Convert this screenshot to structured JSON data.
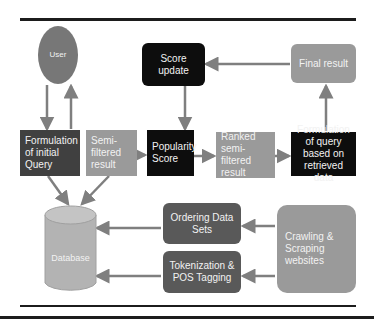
{
  "diagram": {
    "nodes": {
      "user": "User",
      "initial_query": "Formulation of initial Query",
      "semi_filtered": "Semi-filtered result",
      "popularity": "Popularity Score",
      "ranked": "Ranked semi-filtered result",
      "query_retrieved": "Formulation of query based on retrieved data",
      "score_update": "Score update",
      "final_result": "Final result",
      "database": "Database",
      "ordering": "Ordering Data Sets",
      "tokenization": "Tokenization & POS Tagging",
      "crawling": "Crawling & Scraping websites"
    },
    "edges": [
      {
        "from": "user",
        "to": "initial_query"
      },
      {
        "from": "initial_query",
        "to": "user"
      },
      {
        "from": "semi_filtered",
        "to": "popularity"
      },
      {
        "from": "popularity",
        "to": "ranked"
      },
      {
        "from": "ranked",
        "to": "query_retrieved"
      },
      {
        "from": "query_retrieved",
        "to": "final_result"
      },
      {
        "from": "final_result",
        "to": "score_update"
      },
      {
        "from": "score_update",
        "to": "popularity"
      },
      {
        "from": "initial_query",
        "to": "database"
      },
      {
        "from": "semi_filtered",
        "to": "database"
      },
      {
        "from": "crawling",
        "to": "ordering"
      },
      {
        "from": "crawling",
        "to": "tokenization"
      },
      {
        "from": "ordering",
        "to": "database"
      },
      {
        "from": "tokenization",
        "to": "database"
      }
    ],
    "colors": {
      "dark": "#404040",
      "black": "#0d0d0d",
      "grey": "#9a9a9a",
      "mid": "#595959",
      "arrow": "#7f7f7f",
      "rule": "#1c1c1c"
    }
  }
}
